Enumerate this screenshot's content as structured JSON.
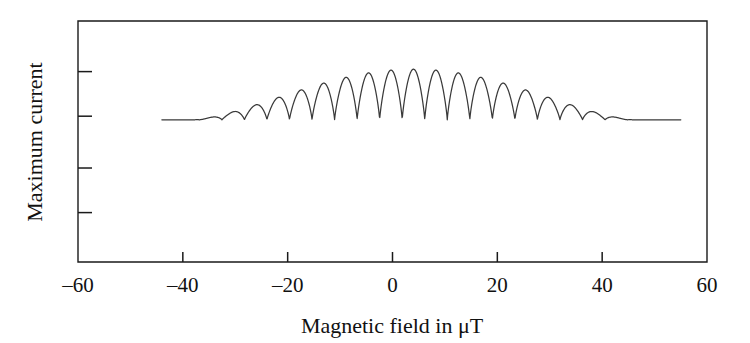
{
  "chart_data": {
    "type": "line",
    "title": "",
    "xlabel": "Magnetic field in  μT",
    "ylabel": "Maximum current",
    "xlim": [
      -60,
      60
    ],
    "ylim": [
      0,
      1
    ],
    "grid": false,
    "legend": "none",
    "x_ticks": [
      -60,
      -40,
      -20,
      0,
      20,
      40,
      60
    ],
    "x_tick_labels": [
      "‒60",
      "‒40",
      "‒20",
      "0",
      "20",
      "40",
      "60"
    ],
    "y_ticks_count": 4,
    "y_tick_labels": [],
    "y_tick_positions": [
      0.205,
      0.39,
      0.605,
      0.79
    ],
    "series_name": "interference fringes",
    "data_x_start": -44.0,
    "data_x_end": 55.0,
    "baseline_level": 0.59,
    "peak_level_max": 0.8,
    "fringe_count": 24,
    "fringe_period_uT": 4.3,
    "envelope_center_uT": 4.0,
    "envelope_half_width_uT": 42.0,
    "x": [
      -44.0,
      -43.0,
      -42.0,
      -41.0,
      -40.0,
      -39.0,
      -38.0,
      -37.0,
      -36.0,
      -35.0,
      -34.0,
      -33.0,
      -32.0,
      -31.0,
      -30.0,
      -29.0,
      -28.0,
      -27.0,
      -26.0,
      -25.0,
      -24.0,
      -23.0,
      -22.0,
      -21.0,
      -20.0,
      -19.0,
      -18.0,
      -17.0,
      -16.0,
      -15.0,
      -14.0,
      -13.0,
      -12.0,
      -11.0,
      -10.0,
      -9.0,
      -8.0,
      -7.0,
      -6.0,
      -5.0,
      -4.0,
      -3.0,
      -2.0,
      -1.0,
      0.0,
      1.0,
      2.0,
      3.0,
      4.0,
      5.0,
      6.0,
      7.0,
      8.0,
      9.0,
      10.0,
      11.0,
      12.0,
      13.0,
      14.0,
      15.0,
      16.0,
      17.0,
      18.0,
      19.0,
      20.0,
      21.0,
      22.0,
      23.0,
      24.0,
      25.0,
      26.0,
      27.0,
      28.0,
      29.0,
      30.0,
      31.0,
      32.0,
      33.0,
      34.0,
      35.0,
      36.0,
      37.0,
      38.0,
      39.0,
      40.0,
      41.0,
      42.0,
      43.0,
      44.0,
      45.0,
      46.0,
      47.0,
      48.0,
      49.0,
      50.0,
      51.0,
      52.0,
      53.0,
      54.0,
      55.0
    ],
    "peak_fields": [
      -41.2,
      -36.9,
      -32.6,
      -28.3,
      -24.0,
      -19.7,
      -15.4,
      -11.1,
      -6.8,
      -2.5,
      1.8,
      6.1,
      10.4,
      14.7,
      19.0,
      23.3,
      27.6,
      31.9,
      36.2,
      40.5,
      44.8,
      49.1,
      53.4
    ],
    "peak_amplitudes": [
      0.04,
      0.07,
      0.1,
      0.13,
      0.15,
      0.175,
      0.19,
      0.2,
      0.205,
      0.21,
      0.21,
      0.21,
      0.205,
      0.2,
      0.185,
      0.165,
      0.145,
      0.12,
      0.095,
      0.07,
      0.05,
      0.035,
      0.02
    ]
  },
  "axes": {
    "y_label": "Maximum current",
    "x_label": "Magnetic field in  μT",
    "x_tick_labels": [
      "‒60",
      "‒40",
      "‒20",
      "0",
      "20",
      "40",
      "60"
    ]
  },
  "style": {
    "frame_color": "#1a1a1a",
    "curve_color": "#3a3a3a",
    "text_color": "#111111",
    "background": "#ffffff"
  }
}
